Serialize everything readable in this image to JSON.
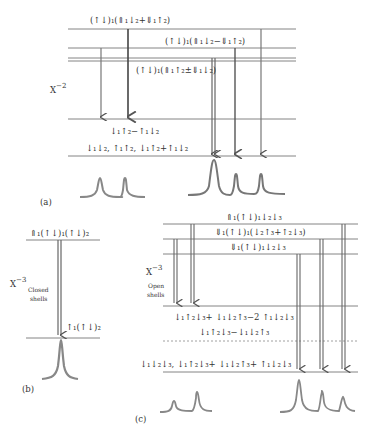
{
  "panel_a": {
    "tag": "(a)",
    "axis_label": "X",
    "axis_exp": "−2",
    "levels": {
      "top1": "(↑↓)₁(⇑₁↓₂+⇓₁↑₂)",
      "top2": "(↑↓)₁(⇑₁↓₂−⇓₁↑₂)",
      "top3": "(↑↓)₁(⇑₁↑₂±⇓₁↓₂)",
      "low1": "↓₁↑₂−↑₁↓₂",
      "low2": "↓₁↓₂, ↑₁↑₂, ↓₁↑₂+↑₁↓₂"
    }
  },
  "panel_b": {
    "tag": "(b)",
    "axis_label": "X",
    "axis_exp": "−3",
    "axis_sub1": "Closed",
    "axis_sub2": "shells",
    "levels": {
      "top": "⇑₁(↑↓)₁(↑↓)₂",
      "low": "↑₁(↑↓)₂"
    }
  },
  "panel_c": {
    "tag": "(c)",
    "axis_label": "X",
    "axis_exp": "−3",
    "axis_sub1": "Open",
    "axis_sub2": "shells",
    "levels": {
      "top1": "⇑₁(↑↓)₁↓₂↓₃",
      "top2": "⇓₁(↑↓)₁(↓₂↑₃+↑₂↓₃)",
      "top3": "⇓₁(↑↓)₁↓₂↓₃",
      "mid1": "↓₁↑₂↓₃+ ↓₁↓₂↑₃−2 ↑₁↓₂↓₃",
      "mid2": "↓₁↑₂↓₃−↓₁↓₂↑₃",
      "low": "↓₁↓₂↓₃, ↓₁↑₂↓₃+ ↓₁↓₂↑₃+ ↑₁↓₂↓₃"
    }
  }
}
